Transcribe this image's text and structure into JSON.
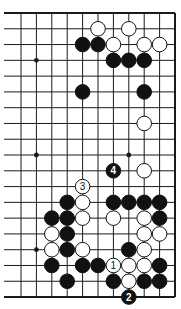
{
  "diagram": {
    "type": "go-board-fragment",
    "visible_columns": 11,
    "visible_rows": 19,
    "edges": [
      "top",
      "right",
      "bottom"
    ],
    "colors": {
      "line": "#1a1a1a",
      "black_stone": "#111111",
      "white_stone": "#ffffff",
      "background": "#ffffff"
    },
    "star_points": [
      [
        1,
        3
      ],
      [
        1,
        9
      ],
      [
        7,
        9
      ],
      [
        1,
        15
      ]
    ],
    "stones": [
      {
        "c": 5,
        "r": 1,
        "color": "white"
      },
      {
        "c": 7,
        "r": 1,
        "color": "white"
      },
      {
        "c": 4,
        "r": 2,
        "color": "black"
      },
      {
        "c": 5,
        "r": 2,
        "color": "black"
      },
      {
        "c": 6,
        "r": 2,
        "color": "white"
      },
      {
        "c": 8,
        "r": 2,
        "color": "white"
      },
      {
        "c": 9,
        "r": 2,
        "color": "white"
      },
      {
        "c": 6,
        "r": 3,
        "color": "black"
      },
      {
        "c": 7,
        "r": 3,
        "color": "black"
      },
      {
        "c": 8,
        "r": 3,
        "color": "black"
      },
      {
        "c": 4,
        "r": 5,
        "color": "black"
      },
      {
        "c": 8,
        "r": 5,
        "color": "black"
      },
      {
        "c": 8,
        "r": 7,
        "color": "white"
      },
      {
        "c": 6,
        "r": 10,
        "color": "black",
        "label": "4"
      },
      {
        "c": 8,
        "r": 10,
        "color": "white"
      },
      {
        "c": 4,
        "r": 11,
        "color": "white",
        "label": "3"
      },
      {
        "c": 3,
        "r": 12,
        "color": "black"
      },
      {
        "c": 4,
        "r": 12,
        "color": "white"
      },
      {
        "c": 6,
        "r": 12,
        "color": "black"
      },
      {
        "c": 7,
        "r": 12,
        "color": "black"
      },
      {
        "c": 8,
        "r": 12,
        "color": "black"
      },
      {
        "c": 9,
        "r": 12,
        "color": "black"
      },
      {
        "c": 2,
        "r": 13,
        "color": "black"
      },
      {
        "c": 3,
        "r": 13,
        "color": "black"
      },
      {
        "c": 4,
        "r": 13,
        "color": "white"
      },
      {
        "c": 6,
        "r": 13,
        "color": "white"
      },
      {
        "c": 8,
        "r": 13,
        "color": "white"
      },
      {
        "c": 9,
        "r": 13,
        "color": "black"
      },
      {
        "c": 2,
        "r": 14,
        "color": "white"
      },
      {
        "c": 3,
        "r": 14,
        "color": "black"
      },
      {
        "c": 8,
        "r": 14,
        "color": "white"
      },
      {
        "c": 9,
        "r": 14,
        "color": "white"
      },
      {
        "c": 2,
        "r": 15,
        "color": "white"
      },
      {
        "c": 3,
        "r": 15,
        "color": "black"
      },
      {
        "c": 4,
        "r": 15,
        "color": "white"
      },
      {
        "c": 7,
        "r": 15,
        "color": "black"
      },
      {
        "c": 8,
        "r": 15,
        "color": "white"
      },
      {
        "c": 2,
        "r": 16,
        "color": "black"
      },
      {
        "c": 4,
        "r": 16,
        "color": "black"
      },
      {
        "c": 5,
        "r": 16,
        "color": "black"
      },
      {
        "c": 6,
        "r": 16,
        "color": "white",
        "label": "1"
      },
      {
        "c": 7,
        "r": 16,
        "color": "white"
      },
      {
        "c": 8,
        "r": 16,
        "color": "white"
      },
      {
        "c": 9,
        "r": 16,
        "color": "black"
      },
      {
        "c": 3,
        "r": 17,
        "color": "black"
      },
      {
        "c": 6,
        "r": 17,
        "color": "black"
      },
      {
        "c": 7,
        "r": 17,
        "color": "white"
      },
      {
        "c": 8,
        "r": 17,
        "color": "black"
      },
      {
        "c": 9,
        "r": 17,
        "color": "black"
      },
      {
        "c": 7,
        "r": 18,
        "color": "black",
        "label": "2"
      }
    ],
    "move_labels": [
      "1",
      "2",
      "3",
      "4"
    ]
  }
}
